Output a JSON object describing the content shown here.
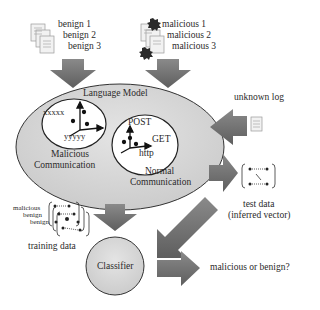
{
  "inputs": {
    "benign": [
      "benign 1",
      "benign 2",
      "benign 3"
    ],
    "malicious": [
      "malicious 1",
      "malicious 2",
      "malicious 3"
    ]
  },
  "language_model": {
    "title": "Language Model",
    "malicious_cluster": {
      "axis_labels": [
        "xxxxx",
        "yyyyy"
      ],
      "label_line1": "Malicious",
      "label_line2": "Communication"
    },
    "normal_cluster": {
      "axis_labels": [
        "POST",
        "GET",
        "http"
      ],
      "label_line1": "Normal",
      "label_line2": "Communication"
    }
  },
  "unknown_log": {
    "label": "unknown log"
  },
  "test_data": {
    "label_line1": "test data",
    "label_line2": "(inferred vector)"
  },
  "training_data": {
    "label": "training data",
    "stack_labels": [
      "malicious",
      "benign",
      "benign"
    ]
  },
  "classifier": {
    "label": "Classifier"
  },
  "output": {
    "label": "malicious or benign?"
  },
  "colors": {
    "arrow": "#6e6e6e",
    "ellipse_fill": "#d9d9d9",
    "ellipse_stroke": "#333333",
    "cluster_fill": "#ffffff",
    "classifier_fill": "#dcdcdc"
  }
}
